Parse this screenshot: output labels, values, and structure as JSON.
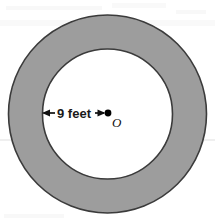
{
  "figure": {
    "type": "geometry-diagram",
    "canvas": {
      "width": 215,
      "height": 223,
      "background": "#ffffff"
    },
    "shapes": {
      "outer_circle": {
        "name": "outer-circle",
        "cx": 107.5,
        "cy": 114,
        "r": 99,
        "fill": "#9d9d9d",
        "stroke": "#3b3b3b",
        "stroke_width": 1.6
      },
      "inner_circle": {
        "name": "inner-circle",
        "cx": 107.5,
        "cy": 114,
        "r": 65,
        "fill": "#ffffff",
        "stroke": "#3b3b3b",
        "stroke_width": 1.6
      },
      "center_point": {
        "name": "center-point",
        "cx": 108,
        "cy": 113,
        "r": 3.4,
        "fill": "#000000"
      }
    },
    "annotations": {
      "radius_dimension": {
        "label": "9 feet",
        "value": 9,
        "unit": "feet",
        "line_y": 113,
        "x_start": 43,
        "x_end": 105,
        "text_x": 74,
        "text_y": 117.5,
        "arrow_color": "#111111",
        "arrowheads": "both"
      },
      "center_label": {
        "label": "O",
        "x": 113,
        "y": 127
      }
    }
  }
}
